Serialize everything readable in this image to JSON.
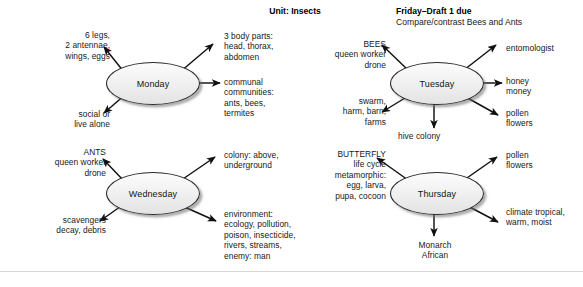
{
  "page": {
    "width": 583,
    "height": 287,
    "background": "#ffffff",
    "divider_color": "#d8d8d8"
  },
  "headings": {
    "unit_title": "Unit: Insects",
    "friday_title": "Friday–Draft 1 due",
    "friday_subtitle": "Compare/contrast Bees and Ants"
  },
  "style": {
    "node_fill_top": "#fcfcfc",
    "node_fill_bottom": "#e3e3e3",
    "node_border": "#2b2b2b",
    "text_color": "#181818",
    "arrow_color": "#111111"
  },
  "clusters": [
    {
      "id": "monday",
      "center_label": "Monday",
      "ellipse": {
        "x": 106,
        "y": 62,
        "w": 92,
        "h": 41
      },
      "branches": [
        {
          "id": "monday-traits",
          "text": "6 legs,\n2 antennae,\nwings, eggs",
          "align": "right",
          "x": 22,
          "y": 30,
          "w": 88
        },
        {
          "id": "monday-body-parts",
          "text": "3 body parts:\nhead, thorax,\nabdomen",
          "align": "left",
          "x": 224,
          "y": 31,
          "w": 95
        },
        {
          "id": "monday-communities",
          "text": "communal\ncommunities:\nants, bees,\ntermites",
          "align": "left",
          "x": 224,
          "y": 77,
          "w": 95
        },
        {
          "id": "monday-social",
          "text": "social or\nlive alone",
          "align": "right",
          "x": 28,
          "y": 109,
          "w": 82
        }
      ]
    },
    {
      "id": "tuesday",
      "center_label": "Tuesday",
      "ellipse": {
        "x": 390,
        "y": 62,
        "w": 92,
        "h": 41
      },
      "branches": [
        {
          "id": "tuesday-bees",
          "text": "BEES\nqueen worker\ndrone",
          "align": "right",
          "x": 300,
          "y": 39,
          "w": 86
        },
        {
          "id": "tuesday-entomologist",
          "text": "entomologist",
          "align": "left",
          "x": 506,
          "y": 43,
          "w": 76
        },
        {
          "id": "tuesday-honey",
          "text": "honey\nmoney",
          "align": "left",
          "x": 506,
          "y": 76,
          "w": 76
        },
        {
          "id": "tuesday-swarm",
          "text": "swarm,\nharm, barn,\nfarms",
          "align": "right",
          "x": 300,
          "y": 96,
          "w": 86
        },
        {
          "id": "tuesday-pollen",
          "text": "pollen\nflowers",
          "align": "left",
          "x": 506,
          "y": 108,
          "w": 76
        },
        {
          "id": "tuesday-hive",
          "text": "hive colony",
          "align": "left",
          "x": 398,
          "y": 131,
          "w": 80
        }
      ]
    },
    {
      "id": "wednesday",
      "center_label": "Wednesday",
      "ellipse": {
        "x": 106,
        "y": 172,
        "w": 92,
        "h": 41
      },
      "branches": [
        {
          "id": "wednesday-ants",
          "text": "ANTS\nqueen worker\ndrone",
          "align": "right",
          "x": 18,
          "y": 147,
          "w": 88
        },
        {
          "id": "wednesday-colony",
          "text": "colony: above,\nunderground",
          "align": "left",
          "x": 224,
          "y": 150,
          "w": 98
        },
        {
          "id": "wednesday-environment",
          "text": "environment:\necology, pollution,\npoison, insecticide,\nrivers, streams,\nenemy: man",
          "align": "left",
          "x": 224,
          "y": 209,
          "w": 100
        },
        {
          "id": "wednesday-scavengers",
          "text": "scavengers\ndecay, debris",
          "align": "right",
          "x": 18,
          "y": 215,
          "w": 88
        }
      ]
    },
    {
      "id": "thursday",
      "center_label": "Thursday",
      "ellipse": {
        "x": 390,
        "y": 172,
        "w": 92,
        "h": 41
      },
      "branches": [
        {
          "id": "thursday-butterfly",
          "text": "BUTTERFLY\nlife cycle\nmetamorphic:\negg, larva,\npupa, cocoon",
          "align": "right",
          "x": 290,
          "y": 149,
          "w": 96
        },
        {
          "id": "thursday-pollen",
          "text": "pollen\nflowers",
          "align": "left",
          "x": 506,
          "y": 150,
          "w": 76
        },
        {
          "id": "thursday-climate",
          "text": "climate tropical,\nwarm, moist",
          "align": "left",
          "x": 506,
          "y": 207,
          "w": 78
        },
        {
          "id": "thursday-monarch",
          "text": "Monarch\nAfrican",
          "align": "center",
          "x": 396,
          "y": 240,
          "w": 78
        }
      ]
    }
  ],
  "arrows": [
    {
      "id": "monday-to-traits",
      "x1": 124,
      "y1": 72,
      "x2": 104,
      "y2": 47
    },
    {
      "id": "monday-to-body-parts",
      "x1": 180,
      "y1": 72,
      "x2": 213,
      "y2": 44
    },
    {
      "id": "monday-to-communities",
      "x1": 199,
      "y1": 83,
      "x2": 220,
      "y2": 83
    },
    {
      "id": "monday-to-social",
      "x1": 126,
      "y1": 94,
      "x2": 104,
      "y2": 113
    },
    {
      "id": "tuesday-to-bees",
      "x1": 408,
      "y1": 70,
      "x2": 382,
      "y2": 45
    },
    {
      "id": "tuesday-to-entomologist",
      "x1": 464,
      "y1": 70,
      "x2": 496,
      "y2": 45
    },
    {
      "id": "tuesday-to-honey",
      "x1": 483,
      "y1": 83,
      "x2": 502,
      "y2": 83
    },
    {
      "id": "tuesday-to-swarm",
      "x1": 410,
      "y1": 95,
      "x2": 382,
      "y2": 112
    },
    {
      "id": "tuesday-to-pollen",
      "x1": 464,
      "y1": 96,
      "x2": 498,
      "y2": 115
    },
    {
      "id": "tuesday-to-hive",
      "x1": 434,
      "y1": 104,
      "x2": 434,
      "y2": 128
    },
    {
      "id": "wednesday-to-ants",
      "x1": 124,
      "y1": 181,
      "x2": 103,
      "y2": 159
    },
    {
      "id": "wednesday-to-colony",
      "x1": 180,
      "y1": 181,
      "x2": 215,
      "y2": 157
    },
    {
      "id": "wednesday-to-environment",
      "x1": 180,
      "y1": 205,
      "x2": 216,
      "y2": 221
    },
    {
      "id": "wednesday-to-scavengers",
      "x1": 124,
      "y1": 204,
      "x2": 100,
      "y2": 221
    },
    {
      "id": "thursday-to-butterfly",
      "x1": 408,
      "y1": 180,
      "x2": 377,
      "y2": 158
    },
    {
      "id": "thursday-to-pollen",
      "x1": 464,
      "y1": 180,
      "x2": 497,
      "y2": 157
    },
    {
      "id": "thursday-to-climate",
      "x1": 464,
      "y1": 204,
      "x2": 498,
      "y2": 222
    },
    {
      "id": "thursday-to-monarch",
      "x1": 434,
      "y1": 214,
      "x2": 434,
      "y2": 236
    }
  ]
}
